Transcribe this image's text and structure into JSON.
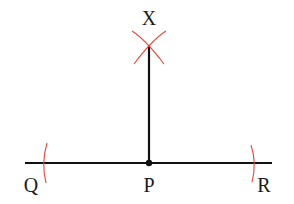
{
  "diagram": {
    "labels": {
      "X": "X",
      "Q": "Q",
      "P": "P",
      "R": "R"
    },
    "colors": {
      "line": "#111111",
      "construction_arc": "#e8473a",
      "label": "#1a1a1a"
    }
  }
}
